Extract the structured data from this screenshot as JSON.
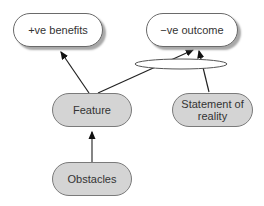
{
  "diagram": {
    "nodes": {
      "pos_benefits": {
        "label": "+ve benefits",
        "style": "white"
      },
      "neg_outcome": {
        "label": "−ve outcome",
        "style": "white"
      },
      "feature": {
        "label": "Feature",
        "style": "gray"
      },
      "statement": {
        "label": "Statement of reality",
        "style": "gray"
      },
      "obstacles": {
        "label": "Obstacles",
        "style": "gray"
      }
    },
    "edges": [
      {
        "from": "feature",
        "to": "pos_benefits"
      },
      {
        "from": "feature",
        "to": "neg_outcome",
        "via": "ellipse-junction"
      },
      {
        "from": "statement",
        "to": "neg_outcome",
        "via": "ellipse-junction"
      },
      {
        "from": "obstacles",
        "to": "feature"
      }
    ],
    "colors": {
      "gray_fill": "#d4d4d4",
      "white_fill": "#ffffff",
      "stroke": "#333333"
    }
  }
}
